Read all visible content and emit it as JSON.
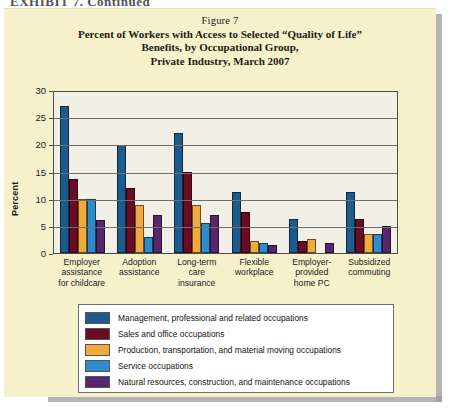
{
  "page": {
    "top_fragment": "EXHIBIT 7. Continued",
    "background_color": "#F6F0CB"
  },
  "figure": {
    "label": "Figure 7",
    "title_lines": [
      "Percent of Workers with Access to Selected “Quality of Life”",
      "Benefits, by Occupational Group,",
      "Private Industry, March 2007"
    ]
  },
  "chart_data": {
    "type": "bar",
    "title": "Percent of Workers with Access to Selected “Quality of Life” Benefits, by Occupational Group, Private Industry, March 2007",
    "xlabel": "",
    "ylabel": "Percent",
    "ylim": [
      0,
      30
    ],
    "yticks": [
      0,
      5,
      10,
      15,
      20,
      25,
      30
    ],
    "grid": true,
    "legend_position": "bottom",
    "categories": [
      "Employer assistance for childcare",
      "Adoption assistance",
      "Long-term care insurance",
      "Flexible workplace",
      "Employer-provided home PC",
      "Subsidized commuting"
    ],
    "category_label_lines": [
      [
        "Employer",
        "assistance",
        "for childcare"
      ],
      [
        "Adoption",
        "assistance"
      ],
      [
        "Long-term",
        "care",
        "insurance"
      ],
      [
        "Flexible",
        "workplace"
      ],
      [
        "Employer-",
        "provided",
        "home PC"
      ],
      [
        "Subsidized",
        "commuting"
      ]
    ],
    "series": [
      {
        "name": "Management, professional and related occupations",
        "color": "#1C5B8C",
        "values": [
          27.0,
          19.8,
          22.0,
          11.2,
          6.2,
          11.3
        ]
      },
      {
        "name": "Sales and office occupations",
        "color": "#6B0B24",
        "values": [
          13.7,
          12.0,
          15.0,
          7.5,
          2.3,
          6.3
        ]
      },
      {
        "name": "Production, transportation, and material moving occupations",
        "color": "#F0AB3C",
        "values": [
          10.0,
          8.8,
          8.8,
          2.2,
          2.5,
          3.5
        ]
      },
      {
        "name": "Service occupations",
        "color": "#2E8BCE",
        "values": [
          10.0,
          3.0,
          5.5,
          1.8,
          0.0,
          3.5
        ]
      },
      {
        "name": "Natural resources, construction, and maintenance occupations",
        "color": "#56276B",
        "values": [
          6.0,
          7.0,
          7.0,
          1.5,
          1.8,
          5.0
        ]
      }
    ]
  }
}
